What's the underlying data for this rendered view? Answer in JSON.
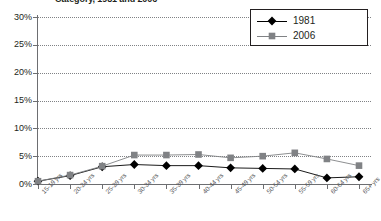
{
  "title": "Category, 1981 and 2006",
  "legend": {
    "position": "top-right",
    "entries": [
      {
        "label": "1981",
        "marker": "diamond",
        "color": "#000000"
      },
      {
        "label": "2006",
        "marker": "square",
        "color": "#808285"
      }
    ]
  },
  "axis": {
    "y_ticks": [
      "0%",
      "5%",
      "10%",
      "15%",
      "20%",
      "25%",
      "30%"
    ],
    "x_ticks": [
      "15-19 yrs",
      "20-24 yrs",
      "25-29 yrs",
      "30-34 yrs",
      "35-39 yrs",
      "40-44 yrs",
      "45-49 yrs",
      "50-54 yrs",
      "55-59 yrs",
      "60-64 yrs",
      "65+ yrs"
    ]
  },
  "chart_data": {
    "type": "line",
    "title": "Category, 1981 and 2006",
    "xlabel": "",
    "ylabel": "",
    "ylim": [
      0,
      30
    ],
    "ytick_step": 5,
    "ytick_format": "percent",
    "grid": true,
    "legend_position": "top-right",
    "categories": [
      "15-19 yrs",
      "20-24 yrs",
      "25-29 yrs",
      "30-34 yrs",
      "35-39 yrs",
      "40-44 yrs",
      "45-49 yrs",
      "50-54 yrs",
      "55-59 yrs",
      "60-64 yrs",
      "65+ yrs"
    ],
    "series": [
      {
        "name": "1981",
        "marker": "diamond",
        "color": "#000000",
        "values": [
          0.5,
          1.5,
          3.1,
          3.5,
          3.3,
          3.3,
          2.9,
          2.8,
          2.7,
          1.1,
          1.3
        ]
      },
      {
        "name": "2006",
        "marker": "square",
        "color": "#808285",
        "values": [
          0.5,
          1.6,
          3.2,
          5.2,
          5.2,
          5.3,
          4.7,
          5.0,
          5.6,
          4.5,
          3.3
        ]
      }
    ]
  }
}
